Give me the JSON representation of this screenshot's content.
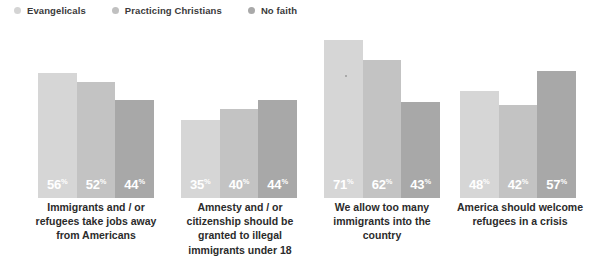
{
  "legend": {
    "items": [
      {
        "label": "Evangelicals",
        "color": "#d4d4d4",
        "dot_name": "legend-dot-evangelicals"
      },
      {
        "label": "Practicing Christians",
        "color": "#c0c0c0",
        "dot_name": "legend-dot-practicing-christians"
      },
      {
        "label": "No faith",
        "color": "#a9a9a9",
        "dot_name": "legend-dot-no-faith"
      }
    ]
  },
  "colors": {
    "evangelicals": "#d6d6d6",
    "practicing_christians": "#c3c3c3",
    "no_faith": "#a8a8a8",
    "value_text": "#ffffff",
    "caption_text": "#2b2b2b",
    "background": "#ffffff"
  },
  "percent_symbol": "%",
  "chart_data": {
    "type": "bar",
    "title": "",
    "xlabel": "",
    "ylabel": "",
    "ylim": [
      0,
      80
    ],
    "grid": false,
    "legend_position": "top-left",
    "categories": [
      "Immigrants and / or refugees take jobs away from Americans",
      "Amnesty and / or citizenship should be granted to illegal immigrants under 18",
      "We allow too many immigrants into the country",
      "America should welcome refugees in a crisis"
    ],
    "series": [
      {
        "name": "Evangelicals",
        "values": [
          56,
          35,
          71,
          48
        ]
      },
      {
        "name": "Practicing Christians",
        "values": [
          52,
          40,
          62,
          42
        ]
      },
      {
        "name": "No faith",
        "values": [
          44,
          44,
          43,
          57
        ]
      }
    ],
    "value_labels": [
      [
        "56",
        "52",
        "44"
      ],
      [
        "35",
        "40",
        "44"
      ],
      [
        "71",
        "62",
        "43"
      ],
      [
        "48",
        "42",
        "57"
      ]
    ]
  },
  "captions": [
    {
      "lines": "Immigrants and / or refugees take jobs away from Americans"
    },
    {
      "lines": "Amnesty and / or citizenship should be granted to illegal immigrants under 18"
    },
    {
      "lines": "We allow too many immigrants into the country"
    },
    {
      "lines": "America should welcome refugees in a crisis"
    }
  ]
}
